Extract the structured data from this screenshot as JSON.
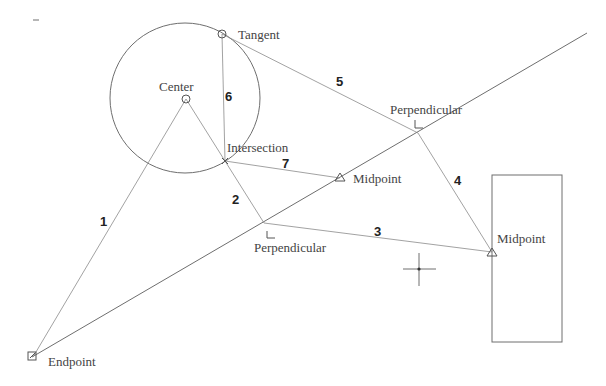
{
  "diagram": {
    "labels": {
      "tangent": "Tangent",
      "center": "Center",
      "intersection": "Intersection",
      "perpendicular_top": "Perpendicular",
      "perpendicular_bottom": "Perpendicular",
      "midpoint_center": "Midpoint",
      "midpoint_right": "Midpoint",
      "endpoint": "Endpoint"
    },
    "segment_numbers": {
      "s1": "1",
      "s2": "2",
      "s3": "3",
      "s4": "4",
      "s5": "5",
      "s6": "6",
      "s7": "7"
    },
    "dash_mark": "–",
    "colors": {
      "line": "#6e6e6e",
      "text": "#444444",
      "background": "#ffffff"
    }
  }
}
